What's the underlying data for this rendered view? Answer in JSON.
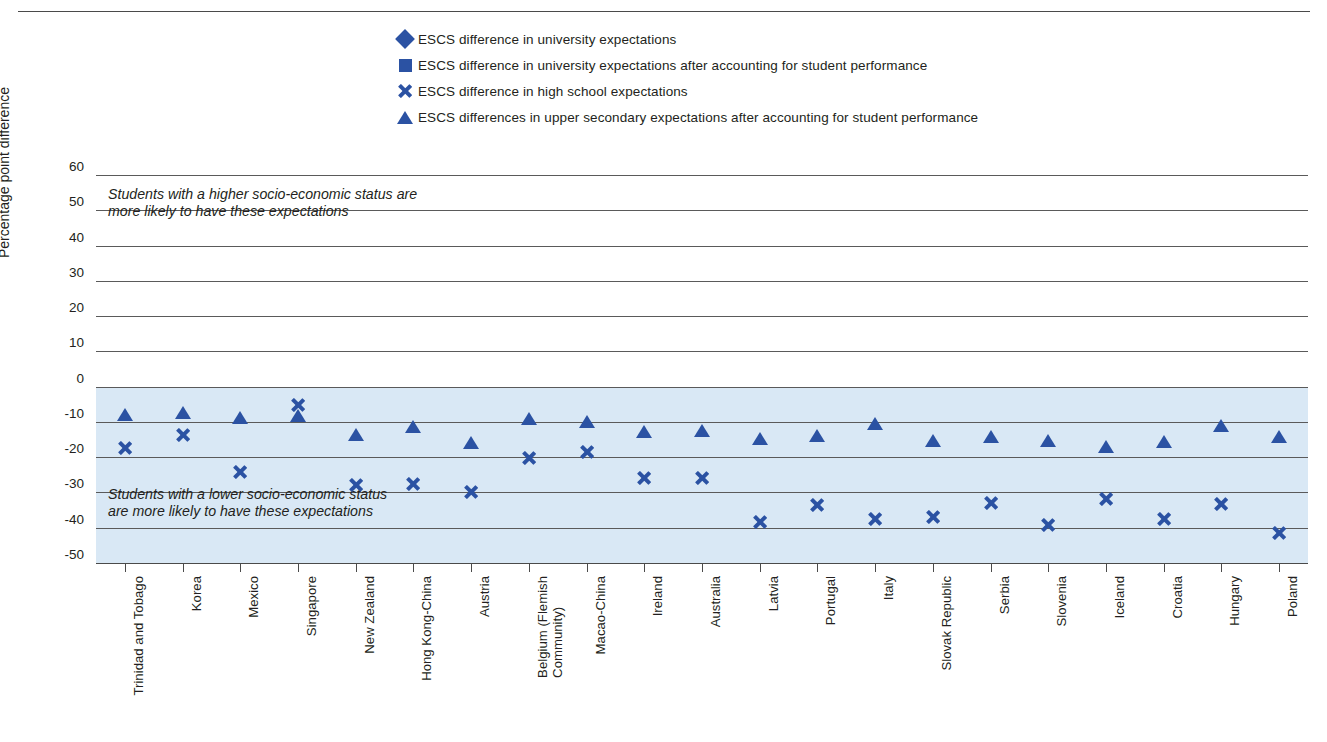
{
  "axis": {
    "ylabel": "Percentage point difference",
    "yticks": [
      60,
      50,
      40,
      30,
      20,
      10,
      0,
      -10,
      -20,
      -30,
      -40,
      -50
    ],
    "ylim": [
      -50,
      60
    ]
  },
  "annotations": {
    "high": "Students with a higher socio-economic status are\nmore likely to have these expectations",
    "low": "Students with a lower socio-economic status\nare more likely to have these expectations"
  },
  "legend": [
    {
      "marker": "diamond",
      "label": "ESCS difference in university expectations"
    },
    {
      "marker": "square",
      "label": "ESCS difference in university expectations after accounting for student performance"
    },
    {
      "marker": "cross",
      "label": "ESCS difference in high school expectations"
    },
    {
      "marker": "triangle",
      "label": "ESCS differences in upper secondary expectations after accounting for student performance"
    }
  ],
  "colors": {
    "marker": "#2B52A3",
    "band": "#d9e8f5",
    "gridline": "#5a5a5a",
    "text": "#231f20"
  },
  "chart_data": {
    "type": "scatter",
    "title": "",
    "xlabel": "",
    "ylabel": "Percentage point difference",
    "ylim": [
      -50,
      60
    ],
    "grid": true,
    "legend_position": "top",
    "categories": [
      "Trinidad and Tobago",
      "Korea",
      "Mexico",
      "Singapore",
      "New Zealand",
      "Hong Kong-China",
      "Austria",
      "Belgium (Flemish\nCommunity)",
      "Macao-China",
      "Ireland",
      "Australia",
      "Latvia",
      "Portugal",
      "Italy",
      "Slovak Republic",
      "Serbia",
      "Slovenia",
      "Iceland",
      "Croatia",
      "Hungary",
      "Poland"
    ],
    "series": [
      {
        "name": "ESCS difference in university expectations",
        "marker": "diamond",
        "values": [
          20.3,
          28.4,
          35.0,
          30.6,
          31.0,
          31.0,
          31.6,
          41.2,
          22.7,
          34.6,
          36.7,
          30.0,
          46.0,
          37.6,
          39.0,
          40.6,
          39.0,
          41.3,
          41.3,
          50.7,
          42.3
        ]
      },
      {
        "name": "ESCS difference in university expectations after accounting for student performance",
        "marker": "square",
        "values": [
          3.6,
          4.2,
          6.2,
          6.1,
          9.8,
          10.5,
          10.7,
          11.0,
          11.6,
          11.8,
          11.5,
          12.2,
          12.2,
          13.4,
          14.0,
          15.2,
          15.0,
          17.6,
          17.6,
          18.3,
          19.0
        ]
      },
      {
        "name": "ESCS difference in high school expectations",
        "marker": "cross",
        "values": [
          -15.0,
          -11.5,
          -22.0,
          -3.0,
          -25.6,
          -25.4,
          -27.5,
          -18.0,
          -16.4,
          -23.7,
          -23.5,
          -36.0,
          -31.4,
          -35.3,
          -34.8,
          -30.8,
          -37.0,
          -29.6,
          -35.3,
          -31.0,
          -39.3
        ]
      },
      {
        "name": "ESCS differences in upper secondary expectations after accounting for student performance",
        "marker": "triangle",
        "values": [
          -3.9,
          -3.3,
          -4.6,
          -4.0,
          -9.4,
          -7.3,
          -11.8,
          -5.0,
          -5.7,
          -8.5,
          -8.2,
          -10.7,
          -9.8,
          -6.3,
          -11.3,
          -10.0,
          -11.1,
          -13.0,
          -11.5,
          -6.8,
          -9.9
        ]
      }
    ]
  }
}
